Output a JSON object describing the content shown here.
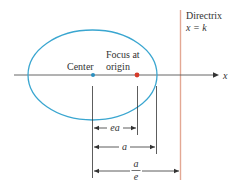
{
  "labels": {
    "directrix_title": "Directrix",
    "directrix_eq": "x = k",
    "center": "Center",
    "focus_line1": "Focus at",
    "focus_line2": "origin",
    "axis": "x",
    "dim_ea": "ea",
    "dim_a": "a",
    "dim_a_over_e_num": "a",
    "dim_a_over_e_den": "e"
  },
  "colors": {
    "ellipse": "#3aa6d0",
    "center_dot": "#2b8fc0",
    "focus_dot": "#d63b2a",
    "directrix": "#e3a894",
    "axis": "#444444",
    "dimension": "#333333"
  }
}
